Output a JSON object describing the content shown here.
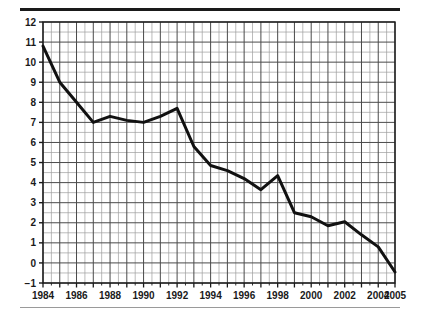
{
  "chart_data": {
    "type": "line",
    "title": "",
    "subtitle": "",
    "xlabel": "",
    "ylabel": "",
    "x": [
      1984,
      1985,
      1986,
      1987,
      1988,
      1989,
      1990,
      1991,
      1992,
      1993,
      1994,
      1995,
      1996,
      1997,
      1998,
      1999,
      2000,
      2001,
      2002,
      2003,
      2004,
      2005
    ],
    "values": [
      10.8,
      9.0,
      8.0,
      7.0,
      7.3,
      7.1,
      7.0,
      7.3,
      7.7,
      5.8,
      4.85,
      4.6,
      4.2,
      3.65,
      4.35,
      2.5,
      2.3,
      1.85,
      2.05,
      1.4,
      0.8,
      -0.45
    ],
    "series": [
      {
        "name": "",
        "values": [
          10.8,
          9.0,
          8.0,
          7.0,
          7.3,
          7.1,
          7.0,
          7.3,
          7.7,
          5.8,
          4.85,
          4.6,
          4.2,
          3.65,
          4.35,
          2.5,
          2.3,
          1.85,
          2.05,
          1.4,
          0.8,
          -0.45
        ]
      }
    ],
    "xlim": [
      1984,
      2005
    ],
    "ylim": [
      -1,
      12
    ],
    "x_tick_labels": [
      "1984",
      "1986",
      "1988",
      "1990",
      "1992",
      "1994",
      "1996",
      "1998",
      "2000",
      "2002",
      "2004",
      "2005"
    ],
    "x_tick_values": [
      1984,
      1986,
      1988,
      1990,
      1992,
      1994,
      1996,
      1998,
      2000,
      2002,
      2004,
      2005
    ],
    "y_tick_labels": [
      "12",
      "11",
      "10",
      "9",
      "8",
      "7",
      "6",
      "5",
      "4",
      "3",
      "2",
      "1",
      "0",
      "−1"
    ],
    "y_tick_values": [
      12,
      11,
      10,
      9,
      8,
      7,
      6,
      5,
      4,
      3,
      2,
      1,
      0,
      -1
    ],
    "grid": true,
    "grid_minor": true,
    "minor_x_divisions": 2,
    "minor_y_divisions": 2,
    "legend": null,
    "legend_position": "none",
    "annotations": [],
    "line_color": "#111111",
    "grid_color_major": "#4a4a4a",
    "grid_color_minor": "#9d9d9d",
    "axis_color": "#1a1a1a",
    "background_color": "#ffffff"
  },
  "decorations": {
    "top_rule_color": "#1a1a1a",
    "bottom_rule_color": "#9a9a9a"
  }
}
